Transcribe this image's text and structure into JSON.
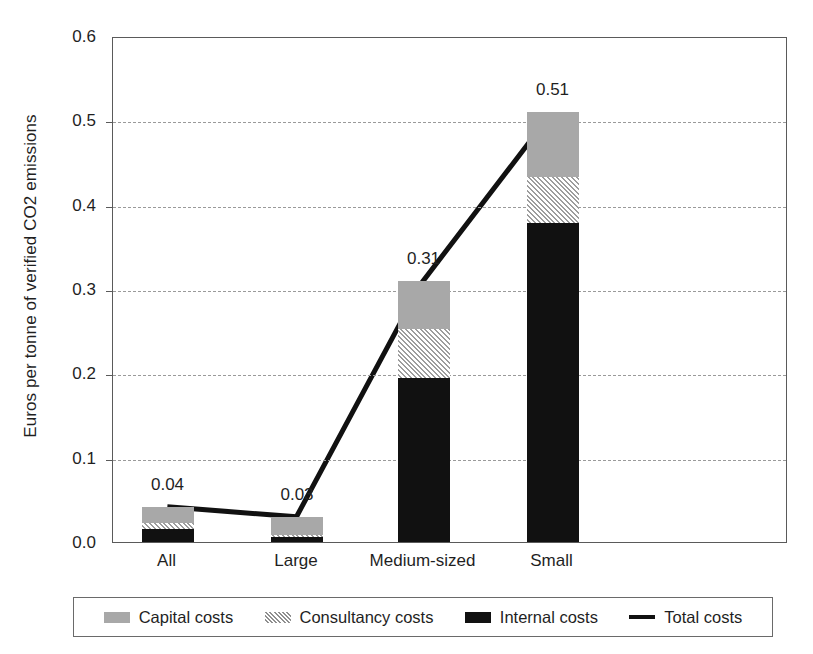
{
  "chart_data": {
    "type": "bar",
    "subtype": "stacked-bar-with-line",
    "title": "",
    "xlabel": "",
    "ylabel": "Euros per tonne of verified CO2 emissions",
    "categories": [
      "All",
      "Large",
      "Medium-sized",
      "Small"
    ],
    "ylim": [
      0.0,
      0.6
    ],
    "yticks": [
      "0.0",
      "0.1",
      "0.2",
      "0.3",
      "0.4",
      "0.5",
      "0.6"
    ],
    "ytick_values": [
      0.0,
      0.1,
      0.2,
      0.3,
      0.4,
      0.5,
      0.6
    ],
    "grid": "horizontal-dashed",
    "legend_position": "bottom",
    "series": [
      {
        "name": "Internal costs",
        "type": "bar",
        "values": [
          0.015,
          0.006,
          0.195,
          0.378
        ]
      },
      {
        "name": "Consultancy costs",
        "type": "bar",
        "values": [
          0.007,
          0.002,
          0.058,
          0.055
        ]
      },
      {
        "name": "Capital costs",
        "type": "bar",
        "values": [
          0.02,
          0.022,
          0.057,
          0.077
        ]
      },
      {
        "name": "Total costs",
        "type": "line",
        "values": [
          0.042,
          0.03,
          0.31,
          0.51
        ]
      }
    ],
    "data_labels": [
      "0.04",
      "0.03",
      "0.31",
      "0.51"
    ],
    "colors": {
      "internal": "#111111",
      "capital": "#a8a8a8",
      "consultancy": "#cfcfcf",
      "total_line": "#111111",
      "gridline": "#9a9a9a",
      "axis": "#5a5a5a"
    }
  },
  "legend": {
    "items": [
      {
        "label": "Capital costs",
        "swatch": "capital-swatch"
      },
      {
        "label": "Consultancy costs",
        "swatch": "consultancy-swatch"
      },
      {
        "label": "Internal costs",
        "swatch": "internal-swatch"
      },
      {
        "label": "Total costs",
        "swatch": "total-line-swatch"
      }
    ]
  }
}
